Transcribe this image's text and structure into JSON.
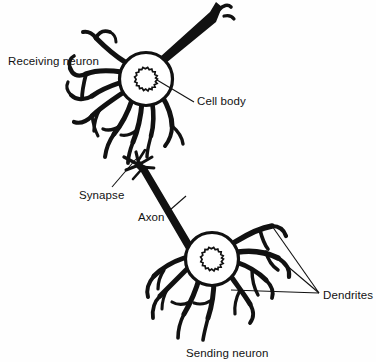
{
  "figure": {
    "background_color": "#fefefe",
    "ink_color": "#111111",
    "width": 376,
    "height": 362
  },
  "labels": {
    "receiving_neuron": "Receiving neuron",
    "cell_body": "Cell body",
    "synapse": "Synapse",
    "axon": "Axon",
    "dendrites": "Dendrites",
    "sending_neuron": "Sending neuron"
  },
  "structures": {
    "receiving_neuron": {
      "soma_label": "receiving-neuron-soma",
      "nucleus_label": "receiving-neuron-nucleus",
      "axon_label": "receiving-neuron-axon",
      "dendrites_label": "receiving-neuron-dendrites"
    },
    "sending_neuron": {
      "soma_label": "sending-neuron-soma",
      "nucleus_label": "sending-neuron-nucleus",
      "axon_label": "sending-neuron-axon",
      "terminal_label": "synaptic-terminal",
      "dendrites_label": "sending-neuron-dendrites"
    }
  }
}
